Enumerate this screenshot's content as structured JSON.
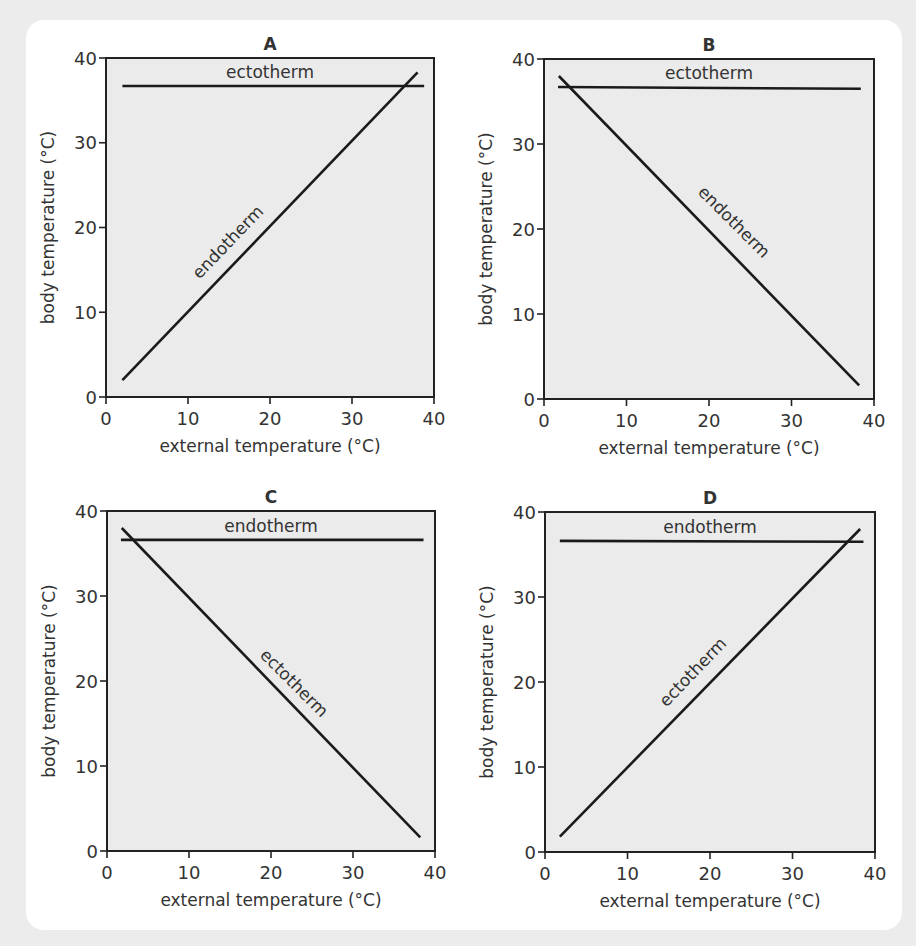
{
  "figure": {
    "background_color": "#ececec",
    "card_color": "#ffffff",
    "plot_background_color": "#ebebeb",
    "line_color": "#1a1a1a"
  },
  "chart_data": [
    {
      "panel": "A",
      "type": "line",
      "title": "A",
      "xlabel": "external temperature (°C)",
      "ylabel": "body temperature (°C)",
      "xlim": [
        0,
        40
      ],
      "ylim": [
        0,
        40
      ],
      "xticks": [
        0,
        10,
        20,
        30,
        40
      ],
      "yticks": [
        0,
        10,
        20,
        30,
        40
      ],
      "grid": false,
      "legend": "inline labels",
      "series": [
        {
          "name": "ectotherm",
          "x": [
            2,
            38.8
          ],
          "y": [
            36.7,
            36.7
          ],
          "label_pos": "above-horizontal"
        },
        {
          "name": "endotherm",
          "x": [
            2,
            38
          ],
          "y": [
            2,
            38.3
          ],
          "label_pos": "along-line-above"
        }
      ]
    },
    {
      "panel": "B",
      "type": "line",
      "title": "B",
      "xlabel": "external temperature (°C)",
      "ylabel": "body temperature (°C)",
      "xlim": [
        0,
        40
      ],
      "ylim": [
        0,
        40
      ],
      "xticks": [
        0,
        10,
        20,
        30,
        40
      ],
      "yticks": [
        0,
        10,
        20,
        30,
        40
      ],
      "grid": false,
      "legend": "inline labels",
      "series": [
        {
          "name": "ectotherm",
          "x": [
            1.7,
            38.4
          ],
          "y": [
            36.7,
            36.5
          ],
          "label_pos": "above-horizontal"
        },
        {
          "name": "endotherm",
          "x": [
            1.8,
            38.2
          ],
          "y": [
            38,
            1.6
          ],
          "label_pos": "along-line-above"
        }
      ]
    },
    {
      "panel": "C",
      "type": "line",
      "title": "C",
      "xlabel": "external temperature (°C)",
      "ylabel": "body temperature (°C)",
      "xlim": [
        0,
        40
      ],
      "ylim": [
        0,
        40
      ],
      "xticks": [
        0,
        10,
        20,
        30,
        40
      ],
      "yticks": [
        0,
        10,
        20,
        30,
        40
      ],
      "grid": false,
      "legend": "inline labels",
      "series": [
        {
          "name": "endotherm",
          "x": [
            1.7,
            38.6
          ],
          "y": [
            36.6,
            36.6
          ],
          "label_pos": "above-horizontal"
        },
        {
          "name": "ectotherm",
          "x": [
            1.8,
            38.2
          ],
          "y": [
            38,
            1.6
          ],
          "label_pos": "along-line-above"
        }
      ]
    },
    {
      "panel": "D",
      "type": "line",
      "title": "D",
      "xlabel": "external temperature (°C)",
      "ylabel": "body temperature (°C)",
      "xlim": [
        0,
        40
      ],
      "ylim": [
        0,
        40
      ],
      "xticks": [
        0,
        10,
        20,
        30,
        40
      ],
      "yticks": [
        0,
        10,
        20,
        30,
        40
      ],
      "grid": false,
      "legend": "inline labels",
      "series": [
        {
          "name": "endotherm",
          "x": [
            1.8,
            38.6
          ],
          "y": [
            36.6,
            36.5
          ],
          "label_pos": "above-horizontal"
        },
        {
          "name": "ectotherm",
          "x": [
            1.8,
            38.2
          ],
          "y": [
            1.8,
            38
          ],
          "label_pos": "along-line-above"
        }
      ]
    }
  ],
  "layout": {
    "panels": [
      {
        "id": "A",
        "plot": {
          "left": 106,
          "top": 58,
          "right": 434,
          "bottom": 397
        },
        "diag_label": {
          "cx": 232,
          "cy": 246,
          "angle": -46
        }
      },
      {
        "id": "B",
        "plot": {
          "left": 544,
          "top": 59,
          "right": 874,
          "bottom": 399
        },
        "diag_label": {
          "cx": 730,
          "cy": 226,
          "angle": 45
        }
      },
      {
        "id": "C",
        "plot": {
          "left": 107,
          "top": 511,
          "right": 435,
          "bottom": 851
        },
        "diag_label": {
          "cx": 290,
          "cy": 687,
          "angle": 45
        }
      },
      {
        "id": "D",
        "plot": {
          "left": 545,
          "top": 512,
          "right": 875,
          "bottom": 852
        },
        "diag_label": {
          "cx": 697,
          "cy": 676,
          "angle": -46
        }
      }
    ]
  }
}
